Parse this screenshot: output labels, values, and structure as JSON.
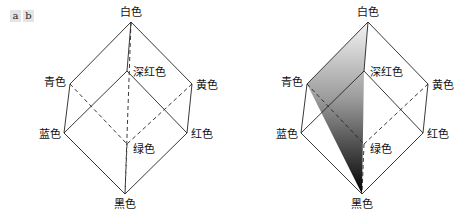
{
  "panel_tags": [
    "a",
    "b"
  ],
  "cubes": [
    {
      "id": "a",
      "shaded": false,
      "labels": {
        "white": "白色",
        "deep_red": "深红色",
        "cyan": "青色",
        "yellow": "黄色",
        "blue": "蓝色",
        "red": "红色",
        "green": "绿色",
        "black": "黑色"
      }
    },
    {
      "id": "b",
      "shaded": true,
      "labels": {
        "white": "白色",
        "deep_red": "深红色",
        "cyan": "青色",
        "yellow": "黄色",
        "blue": "蓝色",
        "red": "红色",
        "green": "绿色",
        "black": "黑色"
      }
    }
  ],
  "colors": {
    "edge": "#222222",
    "gradient_top": "#f2f2f2",
    "gradient_bottom": "#000000",
    "tag_bg": "#e4e4e4"
  }
}
